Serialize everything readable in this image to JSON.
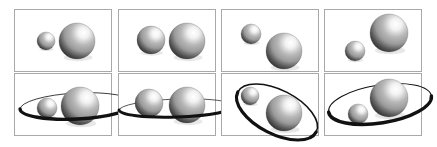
{
  "figure": {
    "title": "",
    "caption": "",
    "background_color": "#ffffff",
    "panel_border_color": "#a9a9a9",
    "rows": 2,
    "columns": 4,
    "panel_width": 98,
    "panel_height": 63,
    "sphere_colors": {
      "highlight": "#ffffff",
      "midtone": "#9a9a9a",
      "shadow": "#2a2a2a",
      "terminator": "#555555"
    },
    "orbit_color": "#111111"
  },
  "chart_data": {
    "type": "scatter",
    "title": "",
    "xlabel": "",
    "ylabel": "",
    "panels": [
      {
        "id": "panel-1",
        "row": 0,
        "column": 0,
        "label": "top-1",
        "has_orbit": false,
        "orbit": null,
        "bodies": [
          {
            "name": "small-sphere",
            "cx": 31,
            "cy": 31,
            "r": 9,
            "light_angle_deg": 45
          },
          {
            "name": "large-sphere",
            "cx": 62,
            "cy": 31,
            "r": 18,
            "light_angle_deg": 45
          }
        ]
      },
      {
        "id": "panel-2",
        "row": 0,
        "column": 1,
        "label": "top-2",
        "has_orbit": false,
        "orbit": null,
        "bodies": [
          {
            "name": "small-sphere",
            "cx": 32,
            "cy": 30,
            "r": 14,
            "light_angle_deg": 45
          },
          {
            "name": "large-sphere",
            "cx": 68,
            "cy": 31,
            "r": 18,
            "light_angle_deg": 45
          }
        ]
      },
      {
        "id": "panel-3",
        "row": 0,
        "column": 2,
        "label": "top-3",
        "has_orbit": false,
        "orbit": null,
        "bodies": [
          {
            "name": "small-sphere",
            "cx": 29,
            "cy": 24,
            "r": 10,
            "light_angle_deg": 45
          },
          {
            "name": "large-sphere",
            "cx": 62,
            "cy": 41,
            "r": 18,
            "light_angle_deg": 45
          }
        ]
      },
      {
        "id": "panel-4",
        "row": 0,
        "column": 3,
        "label": "top-4",
        "has_orbit": false,
        "orbit": null,
        "bodies": [
          {
            "name": "small-sphere",
            "cx": 30,
            "cy": 41,
            "r": 10,
            "light_angle_deg": 45
          },
          {
            "name": "large-sphere",
            "cx": 64,
            "cy": 23,
            "r": 19,
            "light_angle_deg": 45
          }
        ]
      },
      {
        "id": "panel-5",
        "row": 1,
        "column": 0,
        "label": "bottom-1",
        "has_orbit": true,
        "orbit": {
          "cx": 62,
          "cy": 32,
          "rx": 57,
          "ry": 13,
          "rotation_deg": -3,
          "stroke_min": 0.8,
          "stroke_max": 3.4,
          "inclination": "low"
        },
        "bodies": [
          {
            "name": "small-sphere",
            "cx": 32,
            "cy": 34,
            "r": 10,
            "light_angle_deg": 45
          },
          {
            "name": "large-sphere",
            "cx": 65,
            "cy": 32,
            "r": 19,
            "light_angle_deg": 45
          }
        ]
      },
      {
        "id": "panel-6",
        "row": 1,
        "column": 1,
        "label": "bottom-2",
        "has_orbit": true,
        "orbit": {
          "cx": 58,
          "cy": 34,
          "rx": 58,
          "ry": 9,
          "rotation_deg": -2,
          "stroke_min": 0.7,
          "stroke_max": 3.0,
          "inclination": "very-low"
        },
        "bodies": [
          {
            "name": "small-sphere",
            "cx": 30,
            "cy": 29,
            "r": 14,
            "light_angle_deg": 45
          },
          {
            "name": "large-sphere",
            "cx": 68,
            "cy": 31,
            "r": 18,
            "light_angle_deg": 45
          }
        ]
      },
      {
        "id": "panel-7",
        "row": 1,
        "column": 2,
        "label": "bottom-3",
        "has_orbit": true,
        "orbit": {
          "cx": 55,
          "cy": 38,
          "rx": 44,
          "ry": 22,
          "rotation_deg": 27,
          "stroke_min": 1.6,
          "stroke_max": 3.2,
          "inclination": "high"
        },
        "bodies": [
          {
            "name": "small-sphere",
            "cx": 28,
            "cy": 22,
            "r": 9,
            "light_angle_deg": 45
          },
          {
            "name": "large-sphere",
            "cx": 62,
            "cy": 39,
            "r": 18,
            "light_angle_deg": 45
          }
        ]
      },
      {
        "id": "panel-8",
        "row": 1,
        "column": 3,
        "label": "bottom-4",
        "has_orbit": true,
        "orbit": {
          "cx": 55,
          "cy": 30,
          "rx": 52,
          "ry": 19,
          "rotation_deg": -9,
          "stroke_min": 1.0,
          "stroke_max": 3.4,
          "inclination": "medium"
        },
        "bodies": [
          {
            "name": "small-sphere",
            "cx": 33,
            "cy": 40,
            "r": 10,
            "light_angle_deg": 45
          },
          {
            "name": "large-sphere",
            "cx": 64,
            "cy": 24,
            "r": 19,
            "light_angle_deg": 45
          }
        ]
      }
    ]
  }
}
